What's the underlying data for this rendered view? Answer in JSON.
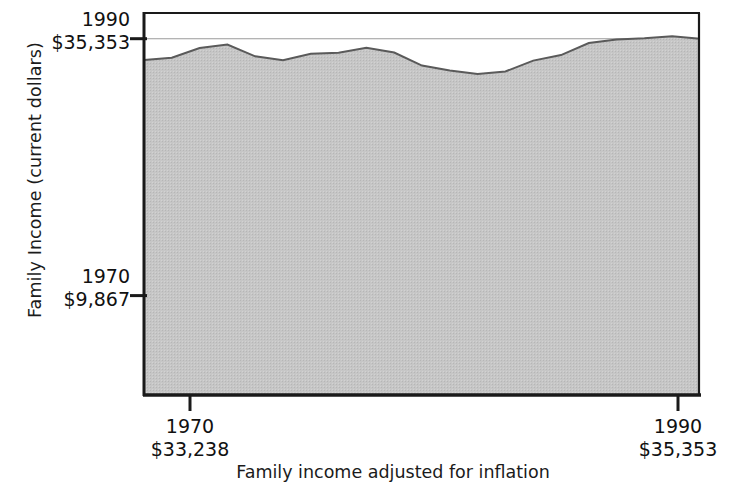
{
  "chart_data": {
    "type": "area",
    "title": "",
    "xlabel": "Family income adjusted for inflation",
    "ylabel": "Family Income (current dollars)",
    "grid": true,
    "legend": "none",
    "xlim": [
      1970,
      1990
    ],
    "ylim": [
      0,
      38000
    ],
    "x_ticks": [
      {
        "year": "1970",
        "amount": "$33,238"
      },
      {
        "year": "1990",
        "amount": "$35,353"
      }
    ],
    "y_ticks": [
      {
        "year": "1990",
        "amount": "$35,353",
        "value": 35353
      },
      {
        "year": "1970",
        "amount": "$9,867",
        "value": 9867
      }
    ],
    "gridline_values": [
      35353,
      29800,
      24200,
      18600,
      13000,
      9867
    ],
    "colors": {
      "current_dollars_fill": "#a3a3a3",
      "adjusted_fill": "#c6c6c6",
      "axis": "#1a1a1a",
      "gridline": "#9a9a9a",
      "curve_line": "#5a5a5a"
    },
    "series": [
      {
        "name": "Family income (current dollars)",
        "fill": "#a3a3a3",
        "x": [
          1970,
          1971,
          1972,
          1973,
          1974,
          1975,
          1976,
          1977,
          1978,
          1979,
          1980,
          1981,
          1982,
          1983,
          1984,
          1985,
          1986,
          1987,
          1988,
          1989,
          1990
        ],
        "values": [
          9867,
          10285,
          11116,
          12051,
          12902,
          13719,
          14958,
          16009,
          17640,
          19587,
          21023,
          22388,
          23433,
          24580,
          26433,
          27735,
          29458,
          30970,
          32191,
          34213,
          35353
        ]
      },
      {
        "name": "Family income adjusted for inflation",
        "fill": "#c6c6c6",
        "x": [
          1970,
          1971,
          1972,
          1973,
          1974,
          1975,
          1976,
          1977,
          1978,
          1979,
          1980,
          1981,
          1982,
          1983,
          1984,
          1985,
          1986,
          1987,
          1988,
          1989,
          1990
        ],
        "values": [
          33238,
          33460,
          34420,
          34780,
          33600,
          33210,
          33860,
          33950,
          34460,
          33980,
          32680,
          32200,
          31860,
          32100,
          33180,
          33720,
          34920,
          35280,
          35400,
          35600,
          35353
        ]
      }
    ],
    "annotation": "Current-dollar income rises steeply while inflation-adjusted income stays nearly flat."
  }
}
